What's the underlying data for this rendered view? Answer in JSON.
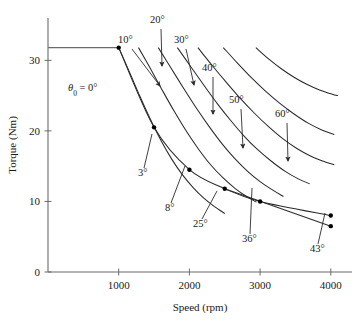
{
  "chart_data": {
    "type": "line",
    "title": "",
    "xlabel": "Speed  (rpm)",
    "ylabel": "Torque (Nm)",
    "xlim": [
      0,
      4300
    ],
    "ylim": [
      0,
      36
    ],
    "xticks": [
      1000,
      2000,
      3000,
      4000
    ],
    "xtick_labels": [
      "1000",
      "2000",
      "3000",
      "4000"
    ],
    "yticks": [
      0,
      10,
      20,
      30
    ],
    "ytick_labels": [
      "0",
      "10",
      "20",
      "30"
    ],
    "grid": false,
    "legend": "none",
    "series": [
      {
        "name": "0°",
        "label": "θ0 = 0°",
        "points": [
          [
            1000,
            31.8
          ],
          [
            1150,
            28.4
          ],
          [
            1300,
            24.9
          ],
          [
            1450,
            21.6
          ],
          [
            1600,
            18.6
          ],
          [
            1750,
            16.0
          ],
          [
            1900,
            13.8
          ],
          [
            2050,
            12.0
          ],
          [
            2200,
            10.5
          ],
          [
            2350,
            9.3
          ],
          [
            2500,
            8.3
          ]
        ]
      },
      {
        "name": "10°",
        "label": "10°",
        "points": [
          [
            1280,
            31.8
          ],
          [
            1450,
            28.8
          ],
          [
            1620,
            25.7
          ],
          [
            1790,
            22.7
          ],
          [
            1960,
            19.9
          ],
          [
            2130,
            17.4
          ],
          [
            2300,
            15.2
          ],
          [
            2470,
            13.4
          ],
          [
            2640,
            11.9
          ],
          [
            2810,
            10.7
          ],
          [
            2950,
            9.9
          ]
        ]
      },
      {
        "name": "20°",
        "label": "20°",
        "points": [
          [
            1560,
            31.8
          ],
          [
            1740,
            28.9
          ],
          [
            1920,
            26.0
          ],
          [
            2100,
            23.2
          ],
          [
            2280,
            20.6
          ],
          [
            2460,
            18.2
          ],
          [
            2640,
            16.1
          ],
          [
            2820,
            14.3
          ],
          [
            3000,
            12.8
          ],
          [
            3180,
            11.6
          ],
          [
            3330,
            10.7
          ]
        ]
      },
      {
        "name": "30°",
        "label": "30°",
        "points": [
          [
            1830,
            31.8
          ],
          [
            2020,
            29.1
          ],
          [
            2210,
            26.4
          ],
          [
            2400,
            23.8
          ],
          [
            2590,
            21.4
          ],
          [
            2780,
            19.2
          ],
          [
            2970,
            17.3
          ],
          [
            3160,
            15.7
          ],
          [
            3350,
            14.3
          ],
          [
            3540,
            13.2
          ],
          [
            3700,
            12.5
          ]
        ]
      },
      {
        "name": "40°",
        "label": "40°",
        "points": [
          [
            2120,
            31.8
          ],
          [
            2320,
            29.3
          ],
          [
            2520,
            26.9
          ],
          [
            2720,
            24.6
          ],
          [
            2920,
            22.5
          ],
          [
            3120,
            20.6
          ],
          [
            3320,
            18.9
          ],
          [
            3520,
            17.5
          ],
          [
            3720,
            16.4
          ],
          [
            3920,
            15.6
          ],
          [
            4050,
            15.2
          ]
        ]
      },
      {
        "name": "50°",
        "label": "50°",
        "points": [
          [
            2480,
            31.8
          ],
          [
            2680,
            29.6
          ],
          [
            2880,
            27.5
          ],
          [
            3080,
            25.6
          ],
          [
            3280,
            23.9
          ],
          [
            3480,
            22.4
          ],
          [
            3680,
            21.1
          ],
          [
            3880,
            20.1
          ],
          [
            4050,
            19.5
          ]
        ]
      },
      {
        "name": "60°",
        "label": "60°",
        "points": [
          [
            2940,
            31.8
          ],
          [
            3120,
            30.2
          ],
          [
            3300,
            28.8
          ],
          [
            3480,
            27.6
          ],
          [
            3660,
            26.6
          ],
          [
            3840,
            25.8
          ],
          [
            4020,
            25.2
          ],
          [
            4100,
            25.0
          ]
        ]
      }
    ],
    "envelope": {
      "name": "operating-envelope",
      "points": [
        [
          1000,
          31.8
        ],
        [
          1500,
          20.5
        ],
        [
          2000,
          14.5
        ],
        [
          2500,
          11.8
        ],
        [
          3000,
          10.0
        ],
        [
          4000,
          8.0
        ]
      ],
      "markers": [
        {
          "x": 1000,
          "y": 31.8,
          "label": "θ0 = 0°"
        },
        {
          "x": 1500,
          "y": 20.5,
          "label": "3°"
        },
        {
          "x": 2000,
          "y": 14.5,
          "label": "8°"
        },
        {
          "x": 2500,
          "y": 11.8,
          "label": "25°"
        },
        {
          "x": 3000,
          "y": 10.0,
          "label": "36°"
        },
        {
          "x": 4000,
          "y": 8.0,
          "label": "43°"
        }
      ]
    },
    "secondary_line": {
      "name": "lower-tangent-line",
      "points": [
        [
          2500,
          11.8
        ],
        [
          4000,
          6.5
        ]
      ],
      "markers": [
        {
          "x": 4000,
          "y": 6.5,
          "label": ""
        }
      ]
    },
    "reference_line": {
      "name": "peak-torque-reference",
      "y": 31.8,
      "x_from": 0,
      "x_to": 1000
    },
    "annotations": [
      {
        "id": "theta0",
        "text": "θ0 = 0°",
        "text_main": "θ",
        "text_sub": "0",
        "text_rest": " = 0°",
        "x": 68,
        "y": 91,
        "arrow": false
      },
      {
        "id": "a10",
        "text": "10°",
        "x": 118,
        "y": 43,
        "arrow": true,
        "arrow_from": [
          132,
          49
        ],
        "arrow_to": [
          160,
          86
        ]
      },
      {
        "id": "a20",
        "text": "20°",
        "x": 150,
        "y": 23,
        "arrow": true,
        "arrow_from": [
          161,
          29
        ],
        "arrow_to": [
          162,
          66
        ]
      },
      {
        "id": "a30",
        "text": "30°",
        "x": 174,
        "y": 43,
        "arrow": true,
        "arrow_from": [
          186,
          49
        ],
        "arrow_to": [
          194,
          85
        ]
      },
      {
        "id": "a40",
        "text": "40°",
        "x": 202,
        "y": 71,
        "arrow": true,
        "arrow_from": [
          213,
          77
        ],
        "arrow_to": [
          213,
          114
        ]
      },
      {
        "id": "a50",
        "text": "50°",
        "x": 229,
        "y": 103,
        "arrow": true,
        "arrow_from": [
          241,
          109
        ],
        "arrow_to": [
          243,
          148
        ]
      },
      {
        "id": "a60",
        "text": "60°",
        "x": 275,
        "y": 117,
        "arrow": true,
        "arrow_from": [
          287,
          123
        ],
        "arrow_to": [
          288,
          161
        ]
      },
      {
        "id": "a3",
        "text": "3°",
        "x": 138,
        "y": 176,
        "arrow": false,
        "leader_from": [
          144,
          168
        ],
        "leader_to": [
          152,
          134
        ]
      },
      {
        "id": "a8",
        "text": "8°",
        "x": 165,
        "y": 211,
        "arrow": false,
        "leader_from": [
          171,
          203
        ],
        "leader_to": [
          185,
          166
        ]
      },
      {
        "id": "a25",
        "text": "25°",
        "x": 193,
        "y": 227,
        "arrow": false,
        "leader_from": [
          202,
          219
        ],
        "leader_to": [
          217,
          191
        ]
      },
      {
        "id": "a36",
        "text": "36°",
        "x": 242,
        "y": 242,
        "arrow": false,
        "leader_from": [
          250,
          234
        ],
        "leader_to": [
          252,
          188
        ]
      },
      {
        "id": "a43",
        "text": "43°",
        "x": 310,
        "y": 252,
        "arrow": false,
        "leader_from": [
          318,
          244
        ],
        "leader_to": [
          325,
          213
        ]
      }
    ]
  },
  "figure": {
    "background": "#ffffff",
    "axis_color": "#6b6b6b",
    "curve_color": "#2b2b2b",
    "marker_color": "#000000",
    "text_color": "#1a1a1a"
  }
}
